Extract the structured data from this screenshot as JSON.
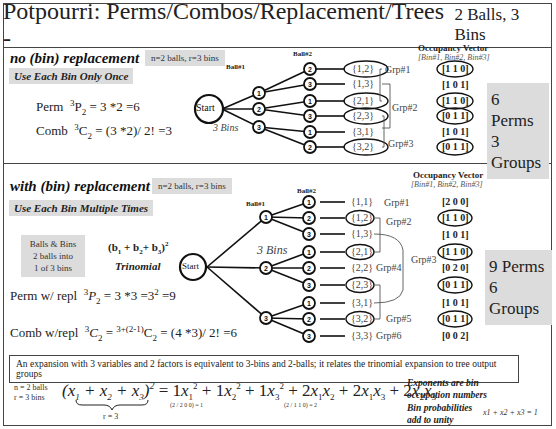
{
  "header": {
    "title": "Potpourri: Perms/Combos/Replacement/Trees -",
    "subtitle": "2 Balls, 3 Bins"
  },
  "no_replacement": {
    "heading": "no (bin) replacement",
    "params": "n=2 balls, r=3 bins",
    "subheading": "Use Each Bin Only Once",
    "perm_label": "Perm",
    "perm_formula": "3P2 = 3 *2 =6",
    "comb_label": "Comb",
    "comb_formula": "3C2 = (3 *2)/ 2! =3",
    "tree": {
      "start_label": "Start",
      "bins_label": "3 Bins",
      "ball1_label": "Ball#1",
      "ball2_label": "Ball#2",
      "level1": [
        "1",
        "2",
        "3"
      ],
      "level2": [
        "2",
        "3",
        "1",
        "3",
        "1",
        "2"
      ],
      "leaves": [
        "{1,2}",
        "{1,3}",
        "{2,1}",
        "{2,3}",
        "{3,1}",
        "{3,2}"
      ],
      "circled_leaves": [
        true,
        false,
        true,
        true,
        false,
        true
      ],
      "groups": [
        "Grp#1",
        "Grp#2",
        "Grp#3"
      ]
    },
    "occupancy": {
      "title": "Occupancy Vector",
      "subtitle": "[Bin#1, Bin#2, Bin#3]",
      "vectors": [
        "[1 1 0]",
        "[1 0 1]",
        "[1 1 0]",
        "[0 1 1]",
        "[1 0 1]",
        "[0 1 1]"
      ],
      "circled": [
        true,
        false,
        true,
        true,
        false,
        true
      ]
    },
    "summary_perms": "6 Perms",
    "summary_groups": "3 Groups"
  },
  "with_replacement": {
    "heading": "with (bin) replacement",
    "params": "n=2 balls, r=3 bins",
    "subheading": "Use Each Bin Multiple Times",
    "balls_bins_box": [
      "Balls & Bins",
      "2 balls into",
      "1 of 3 bins"
    ],
    "trinomial_formula": "(b1 + b2+ b3)2",
    "trinomial_label": "Trinomial",
    "perm_label": "Perm w/ repl",
    "perm_formula": "3P2 = 3 *3 =3² =9",
    "comb_label": "Comb w/repl",
    "comb_formula": "3C2 = 3+(2-1)C2 = (4 *3)/ 2! =6",
    "tree": {
      "start_label": "Start",
      "bins_label": "3 Bins",
      "ball1_label": "Ball#1",
      "ball2_label": "Ball#2",
      "level1": [
        "1",
        "2",
        "3"
      ],
      "level2": [
        "1",
        "2",
        "3",
        "1",
        "2",
        "3",
        "1",
        "2",
        "3"
      ],
      "leaves": [
        "{1,1}",
        "{1,2}",
        "{1,3}",
        "{2,1}",
        "{2,2}",
        "{2,3}",
        "{3,1}",
        "{3,2}",
        "{3,3}"
      ],
      "circled_leaves": [
        false,
        true,
        false,
        true,
        false,
        true,
        false,
        true,
        false
      ],
      "groups": [
        "Grp#1",
        "Grp#2",
        "Grp#3",
        "Grp#4",
        "Grp#5",
        "Grp#6"
      ]
    },
    "occupancy": {
      "title": "Occupancy Vector",
      "subtitle": "[Bin#1, Bin#2, Bin#3]",
      "vectors": [
        "[2 0 0]",
        "[1 1 0]",
        "[1 0 1]",
        "[1 1 0]",
        "[0 2 0]",
        "[0 1 1]",
        "[1 0 1]",
        "[0 1 1]",
        "[0 0 2]"
      ],
      "circled": [
        false,
        true,
        false,
        true,
        false,
        true,
        false,
        true,
        false
      ]
    },
    "summary_perms": "9 Perms",
    "summary_groups": "6 Groups"
  },
  "footer": {
    "note": "An expansion with 3 variables and 2 factors is equivalent to 3-bins and 2-balls; it relates the trinomial expansion to  tree output groups",
    "n_label": "n = 2 balls",
    "r_label": "r = 3 bins",
    "expansion_lhs": "(x1 + x2 + x3)2",
    "expansion_rhs": "= 1x1² + 1x2² + 1x3² + 2x1x2 + 2x1x3 + 2x2x3",
    "brace_label": "r = 3",
    "multinomial_1": "(2 / 2 0 0) = 1",
    "multinomial_2": "(2 / 1 1 0) = 2",
    "exponents_note": [
      "Exponents are bin",
      "occupation numbers"
    ],
    "prob_note": [
      "Bin probabilities",
      "add to unity"
    ],
    "prob_eq": "x1 + x2 + x3 = 1"
  }
}
